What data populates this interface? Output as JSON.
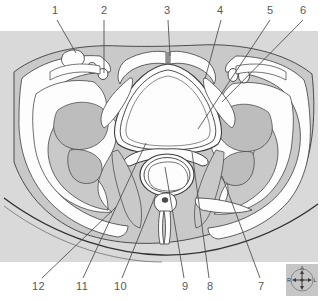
{
  "figure": {
    "type": "anatomical-cross-section",
    "panel": {
      "background_color": "#d9d9d9",
      "outer_background_color": "#ffffff",
      "x": 0,
      "y": 31,
      "width": 318,
      "height": 231
    },
    "colors": {
      "panel_gray": "#d9d9d9",
      "tissue_gray": "#c9c9c9",
      "fat_white": "#fdfdfd",
      "bone_gray": "#bdbdbd",
      "outline": "#3c3c3c",
      "leader_line": "#4a4a4a",
      "label_text": "#585858"
    }
  },
  "labels": {
    "top": [
      {
        "id": "1",
        "text": "1",
        "x": 52,
        "y": 6,
        "leader": {
          "x1": 57,
          "y1": 20,
          "x2": 76,
          "y2": 53
        }
      },
      {
        "id": "2",
        "text": "2",
        "x": 101,
        "y": 6,
        "leader": {
          "x1": 104,
          "y1": 20,
          "x2": 104,
          "y2": 73
        }
      },
      {
        "id": "3",
        "text": "3",
        "x": 164,
        "y": 6,
        "leader": {
          "x1": 168,
          "y1": 20,
          "x2": 170,
          "y2": 56
        }
      },
      {
        "id": "4",
        "text": "4",
        "x": 217,
        "y": 6,
        "leader": {
          "x1": 221,
          "y1": 20,
          "x2": 205,
          "y2": 79
        }
      },
      {
        "id": "5",
        "text": "5",
        "x": 267,
        "y": 6,
        "leader": {
          "x1": 270,
          "y1": 20,
          "x2": 198,
          "y2": 129
        }
      },
      {
        "id": "6",
        "text": "6",
        "x": 300,
        "y": 6,
        "leader": {
          "x1": 303,
          "y1": 20,
          "x2": 222,
          "y2": 102
        }
      }
    ],
    "bottom": [
      {
        "id": "12",
        "text": "12",
        "x": 32,
        "y": 282,
        "leader": {
          "x1": 42,
          "y1": 278,
          "x2": 116,
          "y2": 207
        }
      },
      {
        "id": "11",
        "text": "11",
        "x": 76,
        "y": 282,
        "leader": {
          "x1": 83,
          "y1": 278,
          "x2": 146,
          "y2": 143
        }
      },
      {
        "id": "10",
        "text": "10",
        "x": 114,
        "y": 282,
        "leader": {
          "x1": 122,
          "y1": 278,
          "x2": 156,
          "y2": 194
        }
      },
      {
        "id": "9",
        "text": "9",
        "x": 182,
        "y": 282,
        "leader": {
          "x1": 184,
          "y1": 278,
          "x2": 165,
          "y2": 167
        }
      },
      {
        "id": "8",
        "text": "8",
        "x": 207,
        "y": 282,
        "leader": {
          "x1": 209,
          "y1": 278,
          "x2": 192,
          "y2": 152
        }
      },
      {
        "id": "7",
        "text": "7",
        "x": 258,
        "y": 282,
        "leader": {
          "x1": 260,
          "y1": 278,
          "x2": 222,
          "y2": 176
        }
      }
    ]
  },
  "compass": {
    "name": "orientation-compass",
    "x": 286,
    "y": 264,
    "width": 32,
    "height": 32,
    "background": "#c6c6c6",
    "directions": {
      "top": "A",
      "left": "R",
      "right": "L",
      "bottom": "P"
    }
  }
}
